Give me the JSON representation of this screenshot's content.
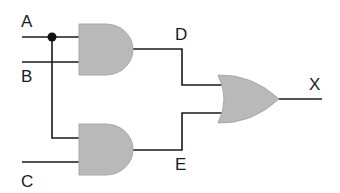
{
  "diagram": {
    "type": "logic-circuit",
    "inputs": [
      {
        "name": "A",
        "label": "A"
      },
      {
        "name": "B",
        "label": "B"
      },
      {
        "name": "C",
        "label": "C"
      }
    ],
    "intermediate": [
      {
        "name": "D",
        "label": "D"
      },
      {
        "name": "E",
        "label": "E"
      }
    ],
    "output": {
      "name": "X",
      "label": "X"
    },
    "gates": [
      {
        "id": "and1",
        "type": "AND",
        "inputs": [
          "A",
          "B"
        ],
        "output": "D"
      },
      {
        "id": "and2",
        "type": "AND",
        "inputs": [
          "A",
          "C"
        ],
        "output": "E"
      },
      {
        "id": "or1",
        "type": "OR",
        "inputs": [
          "D",
          "E"
        ],
        "output": "X"
      }
    ],
    "colors": {
      "gate_fill": "#b9b9b9",
      "wire": "#1a1a1a",
      "background": "#ffffff"
    }
  }
}
